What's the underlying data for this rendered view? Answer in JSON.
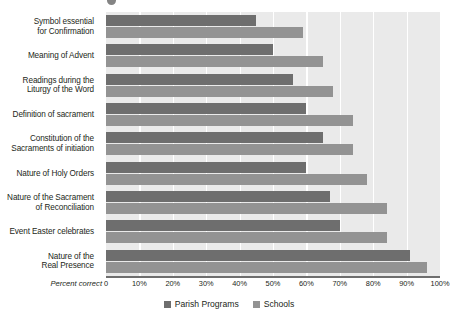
{
  "chart_data": {
    "type": "bar",
    "orientation": "horizontal",
    "title": "",
    "xlabel": "Percent correct",
    "ylabel": "",
    "xlim": [
      0,
      100
    ],
    "grid": true,
    "legend_position": "bottom-center",
    "tick_labels": [
      "0",
      "10%",
      "20%",
      "30%",
      "40%",
      "50%",
      "60%",
      "70%",
      "80%",
      "90%",
      "100%"
    ],
    "tick_values": [
      0,
      10,
      20,
      30,
      40,
      50,
      60,
      70,
      80,
      90,
      100
    ],
    "categories": [
      "Symbol essential for Confirmation",
      "Meaning of Advent",
      "Readings during the Liturgy of the Word",
      "Definition of sacrament",
      "Constitution of the Sacraments of initiation",
      "Nature of Holy Orders",
      "Nature of the Sacrament of Reconciliation",
      "Event Easter celebrates",
      "Nature of the Real Presence"
    ],
    "category_lines": [
      [
        "Symbol essential",
        "for Confirmation"
      ],
      [
        "Meaning of Advent"
      ],
      [
        "Readings during the",
        "Liturgy of the Word"
      ],
      [
        "Definition of sacrament"
      ],
      [
        "Constitution of the",
        "Sacraments of initiation"
      ],
      [
        "Nature of Holy Orders"
      ],
      [
        "Nature of the Sacrament",
        "of Reconciliation"
      ],
      [
        "Event Easter celebrates"
      ],
      [
        "Nature of the",
        "Real Presence"
      ]
    ],
    "series": [
      {
        "name": "Parish Programs",
        "color": "#6e6e6e",
        "values": [
          45,
          50,
          56,
          60,
          65,
          60,
          67,
          70,
          91
        ]
      },
      {
        "name": "Schools",
        "color": "#939393",
        "values": [
          59,
          65,
          68,
          74,
          74,
          78,
          84,
          84,
          96
        ]
      }
    ]
  },
  "icons": {
    "top_mark": "clipped-mark-icon"
  }
}
